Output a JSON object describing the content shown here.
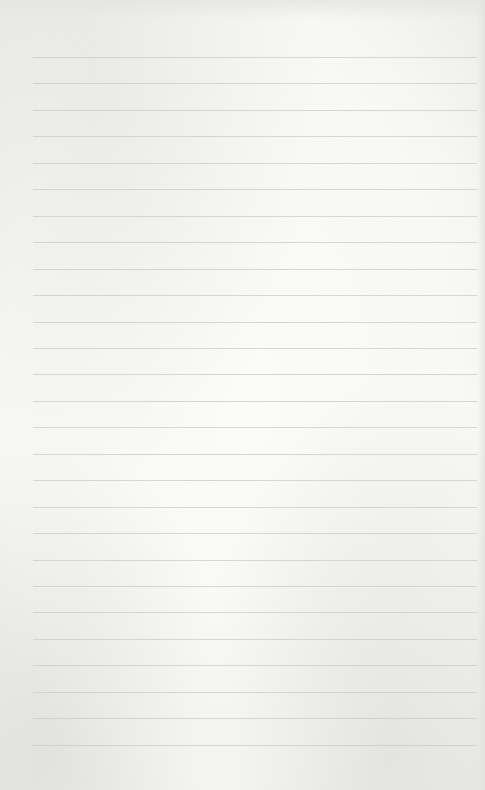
{
  "paper": {
    "type": "ruled-sheet",
    "background_color": "#f7f7f5",
    "rule_color": "#c9c9c6",
    "rule_count": 27,
    "first_rule_y": 57,
    "rule_spacing": 26.45,
    "rule_left": 33,
    "rule_width": 444
  }
}
